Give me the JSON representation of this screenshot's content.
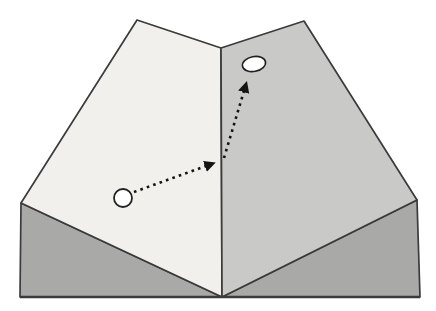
{
  "figure": {
    "canvas": {
      "width": 436,
      "height": 311
    },
    "colors": {
      "background": "#ffffff",
      "left_slope_fill": "#f1f0ec",
      "right_slope_fill": "#c9c9c7",
      "front_left_fill": "#a9a9a7",
      "front_right_fill": "#a9a9a7",
      "outline_stroke": "#3b3b3b",
      "arrow_color": "#141414",
      "ball_fill": "#ffffff",
      "ball_stroke": "#222222",
      "hole_fill": "#ffffff",
      "hole_stroke": "#222222"
    },
    "shapes": {
      "left_slope_points": "137,20 221,48 222,297 21,203",
      "right_slope_points": "221,48 304,21 417,200 222,297",
      "front_left_points": "21,203 222,297 20,297",
      "front_right_points": "417,200 420,297 222,297",
      "bottom_edge": {
        "x1": 20,
        "y1": 297,
        "x2": 420,
        "y2": 297
      }
    },
    "ball": {
      "cx": 123,
      "cy": 198,
      "r": 9
    },
    "hole": {
      "cx": 254,
      "cy": 64,
      "rx": 11.7,
      "ry": 7.4,
      "rotation": -11
    },
    "arrows": [
      {
        "name": "path-arrow-lower",
        "x1": 134,
        "y1": 192,
        "x2": 206,
        "y2": 166
      },
      {
        "name": "path-arrow-upper",
        "x1": 224,
        "y1": 158,
        "x2": 244,
        "y2": 91
      }
    ],
    "arrow_style": {
      "stroke_width": 2.6,
      "dash": "2.6 4.2"
    },
    "outline_width": 1.7
  }
}
